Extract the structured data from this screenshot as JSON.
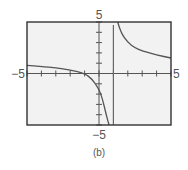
{
  "chart_data": {
    "type": "line",
    "title": "",
    "caption": "(b)",
    "xlabel": "",
    "ylabel": "",
    "xlim": [
      -5,
      5
    ],
    "ylim": [
      -5,
      5
    ],
    "grid": false,
    "x_tick_labels": {
      "min": "−5",
      "max": "5"
    },
    "y_tick_labels": {
      "min": "−5",
      "max": "5"
    },
    "x_ticks": [
      -5,
      -4,
      -3,
      -2,
      -1,
      0,
      1,
      2,
      3,
      4,
      5
    ],
    "y_ticks": [
      -5,
      -4,
      -3,
      -2,
      -1,
      0,
      1,
      2,
      3,
      4,
      5
    ],
    "vertical_asymptote_x": 1,
    "series": [
      {
        "name": "left branch",
        "x": [
          -5,
          -4,
          -3,
          -2,
          -1,
          -0.5,
          0,
          0.25,
          0.5,
          0.7
        ],
        "y": [
          0.8,
          0.7,
          0.55,
          0.35,
          0,
          -0.5,
          -1.5,
          -2.5,
          -4,
          -5
        ]
      },
      {
        "name": "right branch",
        "x": [
          1.3,
          1.5,
          2,
          2.5,
          3,
          4,
          5
        ],
        "y": [
          5,
          4,
          3,
          2.5,
          2.2,
          1.8,
          1.5
        ]
      }
    ],
    "frame_color": "#333333",
    "background_color": "#f2f2f2",
    "curve_color": "#555555"
  }
}
